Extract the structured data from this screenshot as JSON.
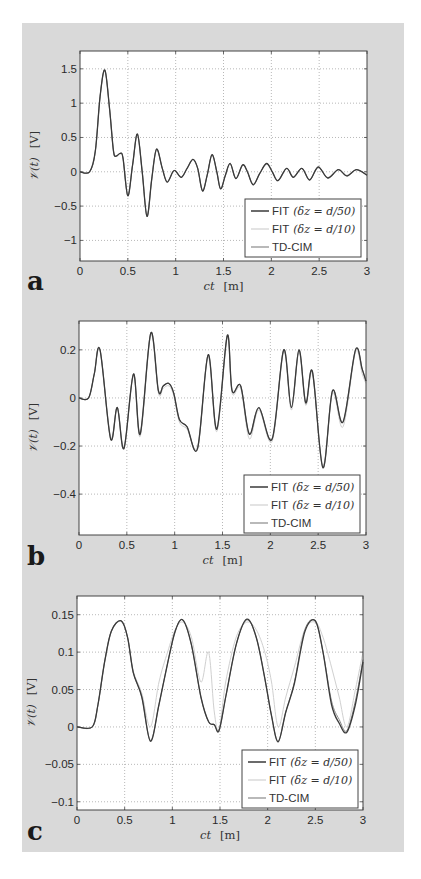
{
  "figure": {
    "background": "#d9d9d9",
    "plot_background": "#ffffff",
    "grid_color": "#9a9a9a",
    "series_colors": {
      "FIT (δz = d/50)": "#3a3a3a",
      "FIT (δz = d/10)": "#d0d0d0",
      "TD-CIM": "#8a8a8a"
    }
  },
  "chart_data": [
    {
      "panel": "a",
      "type": "line",
      "title": "",
      "xlabel": "ct   [m]",
      "ylabel": "𝒱(t)   [V]",
      "xlim": [
        0,
        3
      ],
      "ylim": [
        -1.3,
        1.76
      ],
      "xticks": [
        0,
        0.5,
        1,
        1.5,
        2,
        2.5,
        3
      ],
      "xtick_labels": [
        "0",
        "0.5",
        "1",
        "1.5",
        "2",
        "2.5",
        "3"
      ],
      "yticks": [
        -1,
        -0.5,
        0,
        0.5,
        1,
        1.5
      ],
      "ytick_labels": [
        "−1",
        "−0.5",
        "0",
        "0.5",
        "1",
        "1.5"
      ],
      "grid": true,
      "legend_position": "lower right",
      "legend": [
        "FIT (δz = d/50)",
        "FIT (δz = d/10)",
        "TD-CIM"
      ],
      "x": [
        0,
        0.1,
        0.16,
        0.21,
        0.26,
        0.31,
        0.35,
        0.38,
        0.42,
        0.45,
        0.5,
        0.55,
        0.6,
        0.65,
        0.7,
        0.75,
        0.8,
        0.86,
        0.91,
        0.97,
        1.0,
        1.06,
        1.12,
        1.18,
        1.23,
        1.28,
        1.33,
        1.38,
        1.43,
        1.47,
        1.52,
        1.57,
        1.63,
        1.7,
        1.75,
        1.81,
        1.88,
        1.95,
        2.01,
        2.07,
        2.16,
        2.23,
        2.32,
        2.4,
        2.49,
        2.59,
        2.7,
        2.79,
        2.89,
        3.0
      ],
      "series": [
        {
          "name": "FIT (δz = d/50)",
          "values": [
            0,
            0,
            0.3,
            1.1,
            1.48,
            0.9,
            0.3,
            0.23,
            0.27,
            0.2,
            -0.35,
            0.1,
            0.55,
            0.0,
            -0.65,
            -0.1,
            0.33,
            0.05,
            -0.15,
            0.0,
            0.01,
            -0.08,
            0.05,
            0.18,
            0.05,
            -0.28,
            -0.05,
            0.25,
            0.0,
            -0.25,
            -0.05,
            0.12,
            -0.1,
            0.1,
            0.0,
            -0.19,
            -0.02,
            0.12,
            0.0,
            -0.13,
            0.05,
            -0.08,
            0.05,
            -0.12,
            0.07,
            -0.09,
            0.03,
            -0.06,
            0.03,
            -0.05
          ]
        },
        {
          "name": "FIT (δz = d/10)",
          "values": [
            0,
            0,
            0.3,
            1.1,
            1.47,
            0.9,
            0.3,
            0.23,
            0.26,
            0.2,
            -0.34,
            0.1,
            0.54,
            0.0,
            -0.64,
            -0.1,
            0.32,
            0.05,
            -0.14,
            0.0,
            0.01,
            -0.07,
            0.05,
            0.17,
            0.05,
            -0.27,
            -0.05,
            0.24,
            0.0,
            -0.24,
            -0.05,
            0.11,
            -0.09,
            0.09,
            0.0,
            -0.18,
            -0.02,
            0.11,
            0.0,
            -0.12,
            0.05,
            -0.07,
            0.05,
            -0.11,
            0.06,
            -0.08,
            0.03,
            -0.05,
            0.03,
            -0.04
          ]
        },
        {
          "name": "TD-CIM",
          "values": [
            0,
            0,
            0.3,
            1.1,
            1.48,
            0.9,
            0.3,
            0.23,
            0.27,
            0.2,
            -0.35,
            0.1,
            0.55,
            0.0,
            -0.65,
            -0.1,
            0.33,
            0.05,
            -0.15,
            0.0,
            0.01,
            -0.08,
            0.05,
            0.18,
            0.05,
            -0.28,
            -0.05,
            0.25,
            0.0,
            -0.25,
            -0.05,
            0.12,
            -0.1,
            0.1,
            0.0,
            -0.19,
            -0.02,
            0.12,
            0.0,
            -0.13,
            0.05,
            -0.08,
            0.05,
            -0.12,
            0.07,
            -0.09,
            0.03,
            -0.06,
            0.03,
            -0.05
          ]
        }
      ]
    },
    {
      "panel": "b",
      "type": "line",
      "title": "",
      "xlabel": "ct   [m]",
      "ylabel": "𝒱(t)   [V]",
      "xlim": [
        0,
        3
      ],
      "ylim": [
        -0.57,
        0.32
      ],
      "xticks": [
        0,
        0.5,
        1,
        1.5,
        2,
        2.5,
        3
      ],
      "xtick_labels": [
        "0",
        "0.5",
        "1",
        "1.5",
        "2",
        "2.5",
        "3"
      ],
      "yticks": [
        -0.4,
        -0.2,
        0,
        0.2
      ],
      "ytick_labels": [
        "−0.4",
        "−0.2",
        "0",
        "0.2"
      ],
      "grid": true,
      "legend_position": "lower right",
      "legend": [
        "FIT (δz = d/50)",
        "FIT (δz = d/10)",
        "TD-CIM"
      ],
      "x": [
        0,
        0.1,
        0.16,
        0.22,
        0.33,
        0.4,
        0.47,
        0.57,
        0.64,
        0.75,
        0.83,
        0.88,
        0.94,
        0.99,
        1.05,
        1.13,
        1.24,
        1.35,
        1.44,
        1.55,
        1.6,
        1.69,
        1.78,
        1.88,
        2.02,
        2.14,
        2.22,
        2.3,
        2.37,
        2.44,
        2.55,
        2.65,
        2.76,
        2.89,
        2.96,
        3.0
      ],
      "series": [
        {
          "name": "FIT (δz = d/50)",
          "values": [
            0,
            0,
            0.1,
            0.2,
            -0.17,
            -0.04,
            -0.21,
            0.1,
            -0.15,
            0.27,
            0.03,
            0.05,
            0.06,
            0.02,
            -0.09,
            -0.12,
            -0.21,
            0.18,
            -0.13,
            0.26,
            0.03,
            0.05,
            -0.15,
            -0.04,
            -0.17,
            0.2,
            -0.04,
            0.2,
            -0.02,
            0.11,
            -0.29,
            0.03,
            -0.1,
            0.2,
            0.12,
            0.07
          ]
        },
        {
          "name": "FIT (δz = d/10)",
          "values": [
            0,
            0,
            0.1,
            0.2,
            -0.16,
            -0.04,
            -0.2,
            0.09,
            -0.16,
            0.26,
            0.02,
            0.04,
            0.05,
            0.01,
            -0.1,
            -0.13,
            -0.2,
            0.17,
            -0.14,
            0.25,
            0.02,
            0.04,
            -0.17,
            -0.05,
            -0.18,
            0.19,
            -0.05,
            0.19,
            -0.03,
            0.1,
            -0.28,
            0.02,
            -0.12,
            0.19,
            0.1,
            0.06
          ]
        },
        {
          "name": "TD-CIM",
          "values": [
            0,
            0,
            0.1,
            0.2,
            -0.17,
            -0.04,
            -0.21,
            0.1,
            -0.15,
            0.27,
            0.03,
            0.05,
            0.06,
            0.02,
            -0.09,
            -0.12,
            -0.21,
            0.18,
            -0.13,
            0.26,
            0.03,
            0.05,
            -0.15,
            -0.04,
            -0.17,
            0.2,
            -0.04,
            0.2,
            -0.02,
            0.11,
            -0.29,
            0.03,
            -0.1,
            0.2,
            0.12,
            0.07
          ]
        }
      ]
    },
    {
      "panel": "c",
      "type": "line",
      "title": "",
      "xlabel": "ct   [m]",
      "ylabel": "𝒱(t)   [V]",
      "xlim": [
        0,
        3
      ],
      "ylim": [
        -0.111,
        0.175
      ],
      "xticks": [
        0,
        0.5,
        1,
        1.5,
        2,
        2.5,
        3
      ],
      "xtick_labels": [
        "0",
        "0.5",
        "1",
        "1.5",
        "2",
        "2.5",
        "3"
      ],
      "yticks": [
        -0.1,
        -0.05,
        0,
        0.05,
        0.1,
        0.15
      ],
      "ytick_labels": [
        "−0.1",
        "−0.05",
        "0",
        "0.05",
        "0.1",
        "0.15"
      ],
      "grid": true,
      "legend_position": "lower right",
      "legend": [
        "FIT (δz = d/50)",
        "FIT (δz = d/10)",
        "TD-CIM"
      ],
      "x": [
        0,
        0.16,
        0.22,
        0.29,
        0.36,
        0.46,
        0.53,
        0.59,
        0.68,
        0.77,
        0.86,
        0.95,
        1.03,
        1.11,
        1.2,
        1.3,
        1.38,
        1.44,
        1.49,
        1.56,
        1.67,
        1.78,
        1.88,
        1.97,
        2.04,
        2.11,
        2.19,
        2.28,
        2.39,
        2.5,
        2.58,
        2.67,
        2.75,
        2.83,
        2.92,
        3.0
      ],
      "series": [
        {
          "name": "FIT (δz = d/50)",
          "values": [
            0,
            0,
            0.03,
            0.087,
            0.128,
            0.142,
            0.12,
            0.073,
            0.04,
            -0.019,
            0.03,
            0.085,
            0.128,
            0.143,
            0.11,
            0.04,
            0.007,
            0.003,
            -0.005,
            0.04,
            0.11,
            0.144,
            0.12,
            0.065,
            0.015,
            -0.02,
            0.02,
            0.058,
            0.127,
            0.142,
            0.1,
            0.03,
            0.005,
            -0.007,
            0.03,
            0.087
          ]
        },
        {
          "name": "FIT (δz = d/10)",
          "values": [
            0,
            0,
            0.03,
            0.086,
            0.127,
            0.141,
            0.12,
            0.075,
            0.045,
            0.0,
            0.06,
            0.1,
            0.13,
            0.14,
            0.12,
            0.06,
            0.1,
            0.02,
            -0.003,
            0.06,
            0.12,
            0.14,
            0.13,
            0.1,
            0.06,
            0.0,
            0.04,
            0.08,
            0.13,
            0.14,
            0.12,
            0.08,
            0.04,
            0.0,
            0.05,
            0.1
          ]
        },
        {
          "name": "TD-CIM",
          "values": [
            0,
            0,
            0.03,
            0.087,
            0.128,
            0.142,
            0.12,
            0.073,
            0.04,
            -0.018,
            0.03,
            0.085,
            0.128,
            0.143,
            0.11,
            0.04,
            0.007,
            0.003,
            -0.004,
            0.04,
            0.11,
            0.143,
            0.12,
            0.065,
            0.015,
            -0.019,
            0.02,
            0.06,
            0.13,
            0.141,
            0.1,
            0.035,
            0.01,
            -0.005,
            0.035,
            0.09
          ]
        }
      ]
    }
  ],
  "panels": [
    {
      "letter": "a",
      "ylabel_symbol": "𝒱(t)",
      "ylabel_unit": "[V]",
      "xlabel_symbol": "ct",
      "xlabel_unit": "[m]",
      "legend": {
        "items": [
          {
            "prefix": "FIT",
            "math": "(δz = d/50)"
          },
          {
            "prefix": "FIT",
            "math": "(δz = d/10)"
          },
          {
            "prefix": "TD-CIM",
            "math": ""
          }
        ]
      }
    },
    {
      "letter": "b",
      "ylabel_symbol": "𝒱(t)",
      "ylabel_unit": "[V]",
      "xlabel_symbol": "ct",
      "xlabel_unit": "[m]",
      "legend": {
        "items": [
          {
            "prefix": "FIT",
            "math": "(δz = d/50)"
          },
          {
            "prefix": "FIT",
            "math": "(δz = d/10)"
          },
          {
            "prefix": "TD-CIM",
            "math": ""
          }
        ]
      }
    },
    {
      "letter": "c",
      "ylabel_symbol": "𝒱(t)",
      "ylabel_unit": "[V]",
      "xlabel_symbol": "ct",
      "xlabel_unit": "[m]",
      "legend": {
        "items": [
          {
            "prefix": "FIT",
            "math": "(δz = d/50)"
          },
          {
            "prefix": "FIT",
            "math": "(δz = d/10)"
          },
          {
            "prefix": "TD-CIM",
            "math": ""
          }
        ]
      }
    }
  ]
}
